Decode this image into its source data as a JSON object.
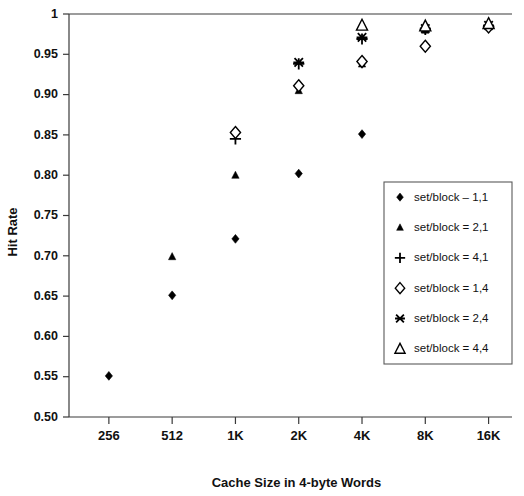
{
  "chart_data": {
    "type": "scatter",
    "title": "",
    "xlabel": "Cache Size in 4-byte Words",
    "ylabel": "Hit Rate",
    "categories": [
      "256",
      "512",
      "1K",
      "2K",
      "4K",
      "8K",
      "16K"
    ],
    "ylim": [
      0.5,
      1.0
    ],
    "yticks": [
      "0.50",
      "0.55",
      "0.60",
      "0.65",
      "0.70",
      "0.75",
      "0.80",
      "0.85",
      "0.90",
      "0.95",
      "1"
    ],
    "ytick_values": [
      0.5,
      0.55,
      0.6,
      0.65,
      0.7,
      0.75,
      0.8,
      0.85,
      0.9,
      0.95,
      1.0
    ],
    "grid": false,
    "legend_position": "inside-right",
    "series": [
      {
        "name": "set/block – 1,1",
        "marker": "filled-diamond",
        "x": [
          "256",
          "512",
          "1K",
          "2K",
          "4K",
          "8K",
          "16K"
        ],
        "values": [
          0.551,
          0.651,
          0.721,
          0.802,
          0.851,
          0.981,
          0.985
        ]
      },
      {
        "name": "set/block = 2,1",
        "marker": "filled-triangle",
        "x": [
          "512",
          "1K",
          "2K",
          "4K",
          "8K",
          "16K"
        ],
        "values": [
          0.699,
          0.8,
          0.905,
          0.938,
          0.98,
          0.984
        ]
      },
      {
        "name": "set/block = 4,1",
        "marker": "plus",
        "x": [
          "1K",
          "2K",
          "4K",
          "8K",
          "16K"
        ],
        "values": [
          0.845,
          0.938,
          0.969,
          0.981,
          0.985
        ]
      },
      {
        "name": "set/block = 1,4",
        "marker": "open-diamond",
        "x": [
          "1K",
          "2K",
          "4K",
          "8K",
          "16K"
        ],
        "values": [
          0.853,
          0.911,
          0.941,
          0.96,
          0.984
        ]
      },
      {
        "name": "set/block = 2,4",
        "marker": "x-star",
        "x": [
          "2K",
          "4K",
          "8K",
          "16K"
        ],
        "values": [
          0.94,
          0.971,
          0.982,
          0.986
        ]
      },
      {
        "name": "set/block = 4,4",
        "marker": "open-triangle",
        "x": [
          "4K",
          "8K",
          "16K"
        ],
        "values": [
          0.986,
          0.985,
          0.988
        ]
      }
    ]
  },
  "legend": {
    "items": [
      {
        "marker": "filled-diamond",
        "label": "set/block – 1,1"
      },
      {
        "marker": "filled-triangle",
        "label": "set/block = 2,1"
      },
      {
        "marker": "plus",
        "label": "set/block = 4,1"
      },
      {
        "marker": "open-diamond",
        "label": "set/block = 1,4"
      },
      {
        "marker": "x-star",
        "label": "set/block = 2,4"
      },
      {
        "marker": "open-triangle",
        "label": "set/block = 4,4"
      }
    ]
  },
  "colors": {
    "ink": "#000000",
    "axis": "#3a3a3a",
    "legend_border": "#5a5a5a",
    "background": "#ffffff"
  }
}
